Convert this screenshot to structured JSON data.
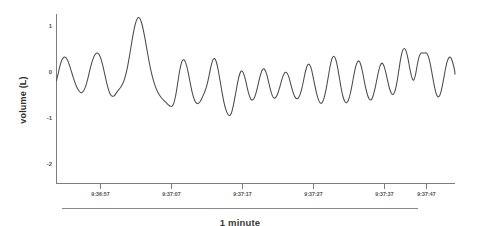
{
  "figure": {
    "background_color": "#ffffff",
    "caption": "1 minute",
    "scalebar_name": "one-minute-scale-bar"
  },
  "chart_data": {
    "type": "line",
    "title": "",
    "subtitle": "",
    "xlabel": "",
    "ylabel": "volume (L)",
    "grid": false,
    "legend": false,
    "legend_position": "none",
    "line_color": "#4a4a4a",
    "axis_color": "#7d7d7d",
    "xlim": [
      0,
      60
    ],
    "ylim": [
      -2.35,
      1.35
    ],
    "yticks": [
      1,
      0,
      -1,
      -2
    ],
    "ytick_labels": [
      "1",
      "0",
      "-1",
      "-2"
    ],
    "xtick_labels": [
      "9:36:57",
      "9:37:07",
      "9:37:17",
      "9:37:27",
      "9:37:37",
      "9:37:47"
    ],
    "xtick_values": [
      6.5,
      16.5,
      26.5,
      36.5,
      46.5,
      56.5
    ],
    "annotation": "1 minute",
    "series": [
      {
        "name": "volume",
        "x": [
          0.0,
          0.28,
          0.56,
          0.84,
          1.12,
          1.4,
          1.68,
          1.96,
          2.24,
          2.52,
          2.8,
          3.08,
          3.36,
          3.64,
          3.92,
          4.2,
          4.48,
          4.76,
          5.04,
          5.32,
          5.6,
          5.88,
          6.16,
          6.44,
          6.72,
          7.0,
          7.28,
          7.56,
          7.84,
          8.12,
          8.4,
          8.68,
          8.96,
          9.24,
          9.52,
          9.8,
          10.08,
          10.36,
          10.64,
          10.92,
          11.2,
          11.48,
          11.76,
          12.04,
          12.32,
          12.6,
          12.88,
          13.16,
          13.44,
          13.72,
          14.0,
          14.28,
          14.56,
          14.84,
          15.12,
          15.4,
          15.68,
          15.96,
          16.24,
          16.52,
          16.8,
          17.08,
          17.36,
          17.64,
          17.92,
          18.2,
          18.48,
          18.76,
          19.04,
          19.32,
          19.6,
          19.88,
          20.16,
          20.44,
          20.72,
          21.0,
          21.28,
          21.56,
          21.84,
          22.12,
          22.4,
          22.68,
          22.96,
          23.24,
          23.52,
          23.8,
          24.08,
          24.36,
          24.64,
          24.92,
          25.2,
          25.48,
          25.76,
          26.04,
          26.32,
          26.6,
          26.88,
          27.16,
          27.44,
          27.72,
          28.0,
          28.28,
          28.56,
          28.84,
          29.12,
          29.4,
          29.68,
          29.96,
          30.24,
          30.52,
          30.8,
          31.08,
          31.36,
          31.64,
          31.92,
          32.2,
          32.48,
          32.76,
          33.04,
          33.32,
          33.6,
          33.88,
          34.16,
          34.44,
          34.72,
          35.0,
          35.28,
          35.56,
          35.84,
          36.12,
          36.4,
          36.68,
          36.96,
          37.24,
          37.52,
          37.8,
          38.08,
          38.36,
          38.64,
          38.92,
          39.2,
          39.48,
          39.76,
          40.04,
          40.32,
          40.6,
          40.88,
          41.16,
          41.44,
          41.72,
          42.0,
          42.28,
          42.56,
          42.84,
          43.12,
          43.4,
          43.68,
          43.96,
          44.24,
          44.52,
          44.8,
          45.08,
          45.36,
          45.64,
          45.92,
          46.2,
          46.48,
          46.76,
          47.04,
          47.32,
          47.6,
          47.88,
          48.16,
          48.44,
          48.72,
          49.0,
          49.28,
          49.56,
          49.84,
          50.12,
          50.4,
          50.68,
          50.96,
          51.24,
          51.52,
          51.8,
          52.08,
          52.36,
          52.64,
          52.92,
          53.2,
          53.48,
          53.76,
          54.04,
          54.32,
          54.6,
          54.88,
          55.16,
          55.44,
          55.72,
          56.0,
          56.28,
          56.56,
          56.84,
          57.12,
          57.4,
          57.68,
          57.96,
          58.24,
          58.52,
          58.8,
          59.08,
          59.36,
          59.64,
          59.92,
          60.0
        ],
        "y": [
          -0.22,
          -0.05,
          0.12,
          0.24,
          0.29,
          0.28,
          0.22,
          0.11,
          -0.02,
          -0.15,
          -0.27,
          -0.37,
          -0.44,
          -0.48,
          -0.47,
          -0.41,
          -0.3,
          -0.15,
          0.02,
          0.17,
          0.29,
          0.36,
          0.38,
          0.34,
          0.24,
          0.09,
          -0.09,
          -0.27,
          -0.42,
          -0.52,
          -0.56,
          -0.55,
          -0.5,
          -0.44,
          -0.39,
          -0.33,
          -0.25,
          -0.13,
          0.04,
          0.26,
          0.5,
          0.74,
          0.95,
          1.09,
          1.15,
          1.12,
          1.0,
          0.82,
          0.6,
          0.37,
          0.15,
          -0.04,
          -0.2,
          -0.33,
          -0.43,
          -0.51,
          -0.57,
          -0.62,
          -0.66,
          -0.7,
          -0.74,
          -0.77,
          -0.78,
          -0.72,
          -0.56,
          -0.32,
          -0.06,
          0.14,
          0.23,
          0.21,
          0.1,
          -0.08,
          -0.29,
          -0.48,
          -0.62,
          -0.7,
          -0.72,
          -0.69,
          -0.62,
          -0.53,
          -0.43,
          -0.3,
          -0.12,
          0.08,
          0.22,
          0.26,
          0.18,
          0.0,
          -0.23,
          -0.47,
          -0.68,
          -0.84,
          -0.94,
          -0.98,
          -0.93,
          -0.78,
          -0.57,
          -0.35,
          -0.15,
          -0.03,
          -0.02,
          -0.11,
          -0.27,
          -0.45,
          -0.58,
          -0.64,
          -0.62,
          -0.53,
          -0.38,
          -0.2,
          -0.05,
          0.03,
          0.02,
          -0.08,
          -0.24,
          -0.41,
          -0.54,
          -0.6,
          -0.58,
          -0.5,
          -0.37,
          -0.22,
          -0.1,
          -0.04,
          -0.06,
          -0.15,
          -0.3,
          -0.45,
          -0.56,
          -0.61,
          -0.6,
          -0.52,
          -0.38,
          -0.19,
          0.0,
          0.12,
          0.13,
          0.04,
          -0.14,
          -0.34,
          -0.52,
          -0.65,
          -0.71,
          -0.69,
          -0.58,
          -0.4,
          -0.17,
          0.06,
          0.24,
          0.31,
          0.26,
          0.1,
          -0.13,
          -0.37,
          -0.56,
          -0.67,
          -0.7,
          -0.64,
          -0.5,
          -0.3,
          -0.08,
          0.1,
          0.2,
          0.19,
          0.07,
          -0.12,
          -0.33,
          -0.5,
          -0.61,
          -0.64,
          -0.58,
          -0.44,
          -0.25,
          -0.05,
          0.1,
          0.16,
          0.11,
          -0.03,
          -0.21,
          -0.38,
          -0.49,
          -0.52,
          -0.45,
          -0.27,
          -0.02,
          0.24,
          0.42,
          0.48,
          0.42,
          0.26,
          0.04,
          -0.14,
          -0.21,
          -0.1,
          0.12,
          0.3,
          0.38,
          0.38,
          0.38,
          0.38,
          0.3,
          0.14,
          -0.08,
          -0.3,
          -0.48,
          -0.57,
          -0.55,
          -0.42,
          -0.22,
          0.0,
          0.18,
          0.28,
          0.28,
          0.18,
          0.02,
          -0.08
        ]
      }
    ]
  }
}
